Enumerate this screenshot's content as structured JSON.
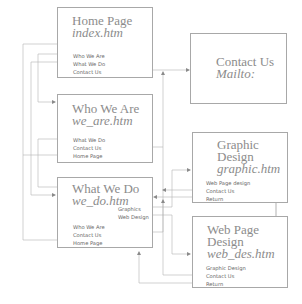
{
  "diagram": {
    "type": "site-map",
    "colors": {
      "line": "#a0a0a0",
      "box_border": "#a8a8a8",
      "title": "#8c8c8c",
      "link": "#666666"
    },
    "nodes": [
      {
        "id": "home",
        "title": "Home Page",
        "file": "index.htm",
        "links": [
          "Who We Are",
          "What We Do",
          "Contact Us"
        ]
      },
      {
        "id": "contact",
        "title": "Contact Us",
        "file": "Mailto:",
        "links": []
      },
      {
        "id": "who",
        "title": "Who We Are",
        "file": "we_are.htm",
        "links": [
          "What We Do",
          "Contact Us",
          "Home Page"
        ]
      },
      {
        "id": "what",
        "title": "What We Do",
        "file": "we_do.htm",
        "sublinks": [
          "Graphics",
          "Web Design"
        ],
        "links": [
          "Who We Are",
          "Contact Us",
          "Home Page"
        ]
      },
      {
        "id": "graphic",
        "title_line1": "Graphic",
        "title_line2": "Design",
        "file": "graphic.htm",
        "links": [
          "Web Page design",
          "Contact Us",
          "Return"
        ]
      },
      {
        "id": "webdes",
        "title_line1": "Web Page",
        "title_line2": "Design",
        "file": "web_des.htm",
        "links": [
          "Graphic Design",
          "Contact Us",
          "Return"
        ]
      }
    ],
    "edges": [
      {
        "from": "home",
        "label": "Who We Are",
        "to": "who"
      },
      {
        "from": "home",
        "label": "What We Do",
        "to": "what"
      },
      {
        "from": "home",
        "label": "Contact Us",
        "to": "contact"
      },
      {
        "from": "who",
        "label": "What We Do",
        "to": "what"
      },
      {
        "from": "who",
        "label": "Contact Us",
        "to": "contact"
      },
      {
        "from": "who",
        "label": "Home Page",
        "to": "home"
      },
      {
        "from": "what",
        "label": "Graphics",
        "to": "graphic"
      },
      {
        "from": "what",
        "label": "Web Design",
        "to": "webdes"
      },
      {
        "from": "what",
        "label": "Contact Us",
        "to": "contact"
      },
      {
        "from": "what",
        "label": "Home Page",
        "to": "home"
      },
      {
        "from": "graphic",
        "label": "Web Page design",
        "to": "webdes"
      },
      {
        "from": "graphic",
        "label": "Contact Us",
        "to": "contact"
      },
      {
        "from": "graphic",
        "label": "Return",
        "to": "what"
      },
      {
        "from": "webdes",
        "label": "Graphic Design",
        "to": "graphic"
      },
      {
        "from": "webdes",
        "label": "Contact Us",
        "to": "contact"
      },
      {
        "from": "webdes",
        "label": "Return",
        "to": "what"
      }
    ]
  }
}
